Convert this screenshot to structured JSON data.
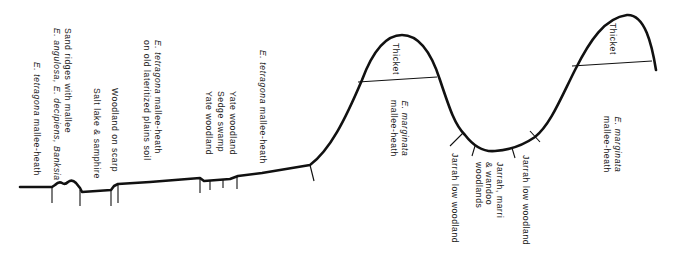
{
  "diagram": {
    "type": "vegetation-profile-transect",
    "line_color": "#111111",
    "labels": {
      "e_tetragona_heath_left": {
        "italic": "E. tetragona",
        "rest": " mallee-heath"
      },
      "sand_ridges": {
        "line1": "Sand ridges with mallee",
        "line2_italic_a": "E. angulosa, E. decipiens, Banksia"
      },
      "salt_lake": "Salt lake & samphire",
      "woodland_scarp": "Woodland on scarp",
      "tetragona_lateritized": {
        "line1_italic": "E. tetragona",
        "line1_rest": " mallee-heath",
        "line2": "on old lateritized plains soil"
      },
      "yate_woodland_1": "Yate woodland",
      "sedge_swamp": "Sedge swamp",
      "yate_woodland_2": "Yate woodland",
      "e_tetragona_heath_right": {
        "italic": "E. tetragona",
        "rest": " mallee-heath"
      },
      "thicket_1": "Thicket",
      "marginata_1": {
        "line1_italic": "E. marginata",
        "line2": "mallee-heath"
      },
      "jarrah_low_1": "Jarrah low woodland",
      "jarrah_marri": {
        "line1": "Jarrah, marri",
        "line2": "& wandoo",
        "line3": "woodlands"
      },
      "jarrah_low_2": "Jarrah low woodland",
      "thicket_2": "Thicket",
      "marginata_2": {
        "line1_italic": "E. marginata",
        "line2": "mallee-heath"
      }
    }
  }
}
